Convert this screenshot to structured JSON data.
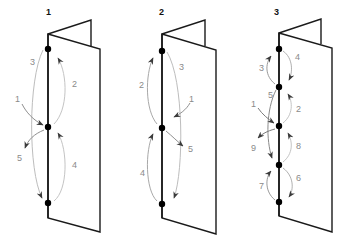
{
  "diagram": {
    "type": "folding-sequence",
    "panels": [
      {
        "title": "1",
        "steps": [
          {
            "n": "1",
            "from": "left-outside",
            "to": "middle-dot"
          },
          {
            "n": "2",
            "from": "middle-dot",
            "to": "top-dot",
            "side": "right"
          },
          {
            "n": "3",
            "from": "top-dot",
            "to": "bottom-dot",
            "side": "left"
          },
          {
            "n": "4",
            "from": "bottom-dot",
            "to": "middle-dot",
            "side": "right"
          },
          {
            "n": "5",
            "from": "middle-dot",
            "to": "left-outside"
          }
        ]
      },
      {
        "title": "2",
        "steps": [
          {
            "n": "1",
            "from": "right-outside",
            "to": "middle-dot"
          },
          {
            "n": "2",
            "from": "middle-dot",
            "to": "top-dot",
            "side": "left"
          },
          {
            "n": "3",
            "from": "top-dot",
            "to": "bottom-dot",
            "side": "right"
          },
          {
            "n": "4",
            "from": "bottom-dot",
            "to": "middle-dot",
            "side": "left"
          },
          {
            "n": "5",
            "from": "middle-dot",
            "to": "right-outside"
          }
        ]
      },
      {
        "title": "3",
        "steps": [
          {
            "n": "1",
            "from": "left-outside",
            "to": "dot-3"
          },
          {
            "n": "2",
            "from": "dot-3",
            "to": "dot-2",
            "side": "right"
          },
          {
            "n": "3",
            "from": "dot-2",
            "to": "dot-1",
            "side": "left"
          },
          {
            "n": "4",
            "from": "dot-1",
            "to": "dot-2",
            "side": "right"
          },
          {
            "n": "5",
            "from": "dot-2",
            "to": "dot-4",
            "side": "left"
          },
          {
            "n": "6",
            "from": "dot-4",
            "to": "dot-5",
            "side": "right"
          },
          {
            "n": "7",
            "from": "dot-5",
            "to": "dot-4",
            "side": "left"
          },
          {
            "n": "8",
            "from": "dot-4",
            "to": "dot-3",
            "side": "right"
          },
          {
            "n": "9",
            "from": "dot-3",
            "to": "left-outside"
          }
        ]
      }
    ]
  }
}
